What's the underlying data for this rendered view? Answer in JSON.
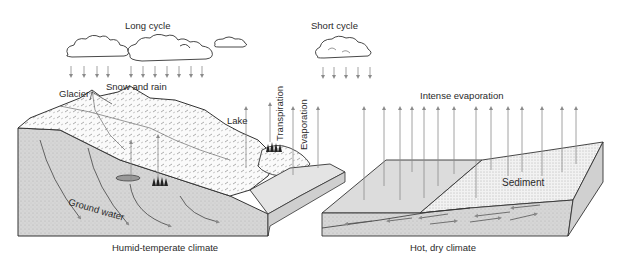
{
  "labels": {
    "long_cycle": "Long cycle",
    "short_cycle": "Short cycle",
    "snow_and_rain": "Snow and rain",
    "glacier": "Glacier",
    "lake": "Lake",
    "transpiration": "Transpiration",
    "evaporation": "Evaporation",
    "intense_evaporation": "Intense evaporation",
    "sediment": "Sediment",
    "ground_water": "Ground water",
    "humid_climate": "Humid-temperate climate",
    "dry_climate": "Hot, dry climate"
  },
  "panels": [
    {
      "name": "humid-temperate",
      "caption_key": "humid_climate"
    },
    {
      "name": "hot-dry",
      "caption_key": "dry_climate"
    }
  ],
  "colors": {
    "line": "#333333",
    "arrow": "#999999",
    "block_side": "#d4d4d4",
    "water_top": "#e2e2e2",
    "sediment": "#ededed"
  }
}
